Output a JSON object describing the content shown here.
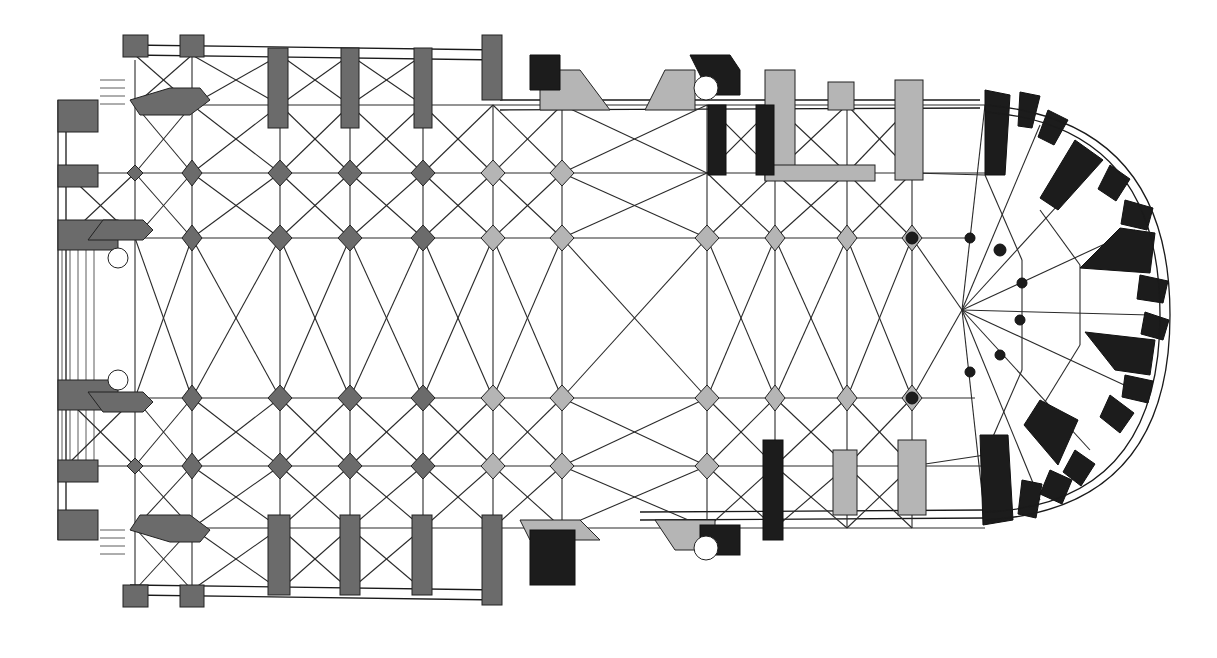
{
  "figure": {
    "type": "architectural-floor-plan",
    "colors": {
      "background": "#ffffff",
      "lines": "#2a2a2a",
      "pier_gray": "#6b6b6b",
      "pier_light": "#b5b5b5",
      "chevet_black": "#1c1c1c"
    },
    "nave_columns_x": [
      135,
      192,
      280,
      350,
      423,
      493,
      562,
      707,
      775,
      847,
      912
    ],
    "rows_y": [
      105,
      173,
      238,
      315,
      398,
      466,
      528
    ],
    "apse": {
      "cx": 980,
      "cy": 315,
      "inner_r": 150,
      "outer_r": 190
    },
    "stair_turrets": [
      {
        "cx": 118,
        "cy": 258
      },
      {
        "cx": 118,
        "cy": 380
      },
      {
        "cx": 706,
        "cy": 88
      },
      {
        "cx": 706,
        "cy": 548
      }
    ]
  }
}
